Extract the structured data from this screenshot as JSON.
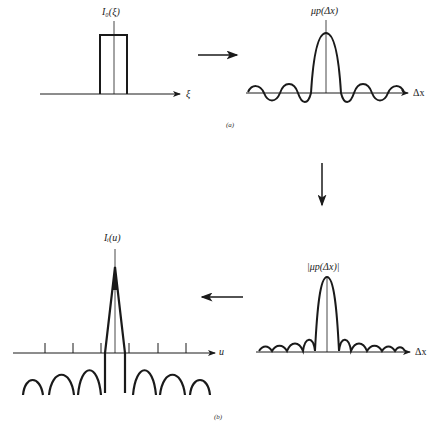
{
  "panel_a": {
    "caption": "(a)",
    "source_plot": {
      "y_label": "I₀(ξ)",
      "x_label": "ξ",
      "shape": "rectangle"
    },
    "arrow": "right",
    "result_plot": {
      "y_label": "μp(Δx)",
      "x_label": "Δx",
      "shape": "sinc"
    }
  },
  "vertical_arrow": "down",
  "panel_b": {
    "caption": "(b)",
    "source_plot": {
      "y_label": "|μp(Δx)|",
      "x_label": "Δx",
      "shape": "|sinc|"
    },
    "arrow": "left",
    "result_plot": {
      "y_label": "Iᵢ(u)",
      "x_label": "u",
      "shape": "triangle-with-sidelobes"
    }
  },
  "colors": {
    "line": "#1a1a1a",
    "background": "#ffffff"
  }
}
